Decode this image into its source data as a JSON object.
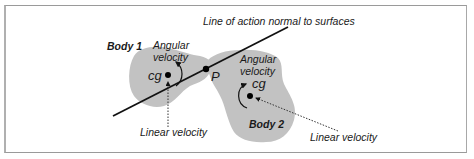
{
  "diagram": {
    "title": "Line of action normal to surfaces",
    "colors": {
      "body_fill": "#c2c2c2",
      "line": "#111111",
      "dot": "#000000",
      "text": "#1a1a1a",
      "frame": "#a0a0a0"
    },
    "body1": {
      "label": "Body 1",
      "cg_label": "cg",
      "angular_label_line1": "Angular",
      "angular_label_line2": "velocity",
      "linear_label": "Linear velocity"
    },
    "body2": {
      "label": "Body 2",
      "cg_label": "cg",
      "angular_label_line1": "Angular",
      "angular_label_line2": "velocity",
      "linear_label": "Linear velocity"
    },
    "contact_point_label": "P"
  }
}
